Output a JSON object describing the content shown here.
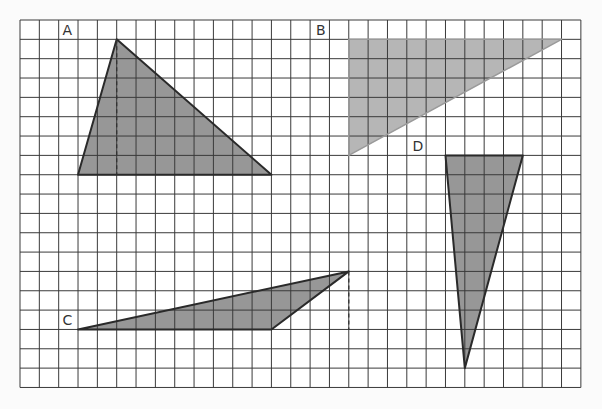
{
  "diagram": {
    "type": "grid-triangles",
    "grid": {
      "origin_px": [
        20,
        20
      ],
      "cell_px": 19.34,
      "columns": 29,
      "rows": 19,
      "line_color": "#3a3a3a",
      "background": "#ffffff"
    },
    "colors": {
      "fill_dark": "#8c8c8c",
      "fill_light": "#a9a9a9",
      "outline": "#2a2a2a",
      "outline_light": "#9a9a9a",
      "dashed": "#333333"
    },
    "shapes": [
      {
        "id": "A",
        "label": "A",
        "label_pos": [
          2.2,
          0.75
        ],
        "vertices": [
          [
            3,
            8
          ],
          [
            5,
            1
          ],
          [
            13,
            8
          ]
        ],
        "fill": "dark",
        "outlined": true,
        "height_line": [
          [
            5,
            1
          ],
          [
            5,
            8
          ]
        ]
      },
      {
        "id": "B",
        "label": "B",
        "label_pos": [
          15.3,
          0.75
        ],
        "vertices": [
          [
            17,
            1
          ],
          [
            28,
            1
          ],
          [
            17,
            7
          ]
        ],
        "fill": "light",
        "outlined": false,
        "height_line": null
      },
      {
        "id": "C",
        "label": "C",
        "label_pos": [
          2.2,
          15.75
        ],
        "vertices": [
          [
            3,
            16
          ],
          [
            13,
            16
          ],
          [
            17,
            13
          ]
        ],
        "fill": "dark",
        "outlined": true,
        "height_line": [
          [
            17,
            13
          ],
          [
            17,
            16
          ]
        ]
      },
      {
        "id": "D",
        "label": "D",
        "label_pos": [
          20.3,
          6.75
        ],
        "vertices": [
          [
            22,
            7
          ],
          [
            26,
            7
          ],
          [
            23,
            18
          ]
        ],
        "fill": "dark",
        "outlined": true,
        "height_line": null
      }
    ]
  }
}
